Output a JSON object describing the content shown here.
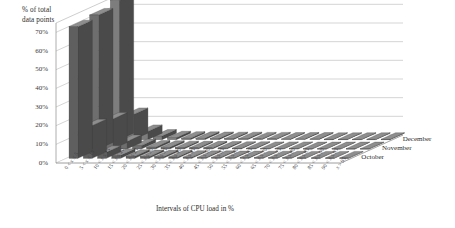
{
  "chart_data": {
    "type": "bar",
    "title": "",
    "subtitle": "",
    "xlabel": "Intervals of CPU load in %",
    "ylabel": "% of total\ndata points",
    "ylabel_line1": "% of total",
    "ylabel_line2": "data points",
    "ylim": [
      0,
      75
    ],
    "yticks": [
      0,
      10,
      20,
      30,
      40,
      50,
      60,
      70
    ],
    "ytick_labels": [
      "0%",
      "10%",
      "20%",
      "30%",
      "40%",
      "50%",
      "60%",
      "70%"
    ],
    "grid": true,
    "grid_axis": "y",
    "projection": "3d",
    "legend_position": "right-depth-axis",
    "categories": [
      "0 < x ≤ 5",
      "5 < x ≤ 10",
      "10 < x ≤ 15",
      "15 < x ≤ 20",
      "20 < x ≤ 25",
      "25 < x ≤ 30",
      "30 < x ≤ 35",
      "35 < x ≤ 40",
      "40 < x ≤ 45",
      "45 < x ≤ 50",
      "50 < x ≤ 55",
      "55 < x ≤ 60",
      "60 < x ≤ 65",
      "65 < x ≤ 70",
      "70 < x ≤ 75",
      "75 < x ≤ 80",
      "80 < x ≤ 85",
      "85 < x ≤ 90",
      "90 < x ≤ 95",
      "x > 95"
    ],
    "series": [
      {
        "name": "October",
        "color": "#5f5f5f",
        "values": [
          70.5,
          17.5,
          3.2,
          1.6,
          1.1,
          0.9,
          0.8,
          0.7,
          0.6,
          0.5,
          0.5,
          0.4,
          0.4,
          0.3,
          0.3,
          0.3,
          0.2,
          0.2,
          0.2,
          0.2
        ]
      },
      {
        "name": "November",
        "color": "#6e6e6e",
        "values": [
          71.8,
          16.0,
          4.0,
          1.8,
          1.0,
          0.9,
          0.7,
          0.6,
          0.6,
          0.5,
          0.4,
          0.4,
          0.3,
          0.3,
          0.3,
          0.2,
          0.2,
          0.2,
          0.2,
          0.2
        ]
      },
      {
        "name": "December",
        "color": "#7d7d7d",
        "values": [
          74.5,
          13.5,
          4.4,
          1.9,
          1.0,
          0.8,
          0.7,
          0.6,
          0.5,
          0.5,
          0.4,
          0.4,
          0.3,
          0.3,
          0.3,
          0.2,
          0.2,
          0.2,
          0.2,
          0.2
        ]
      }
    ],
    "legend": [
      "December",
      "November",
      "October"
    ]
  },
  "legend": {
    "december": "December",
    "november": "November",
    "october": "October"
  },
  "axes": {
    "ytitle_line1": "% of total",
    "ytitle_line2": "data points",
    "xtitle": "Intervals of CPU load in %"
  },
  "colors": {
    "bar_front": "#5f5f5f",
    "bar_top": "#8e8e8e",
    "bar_side": "#4a4a4a",
    "gridline": "#b9b9b9",
    "axis": "#9a9a9a",
    "floor": "#ffffff",
    "text": "#2b2b2b"
  }
}
